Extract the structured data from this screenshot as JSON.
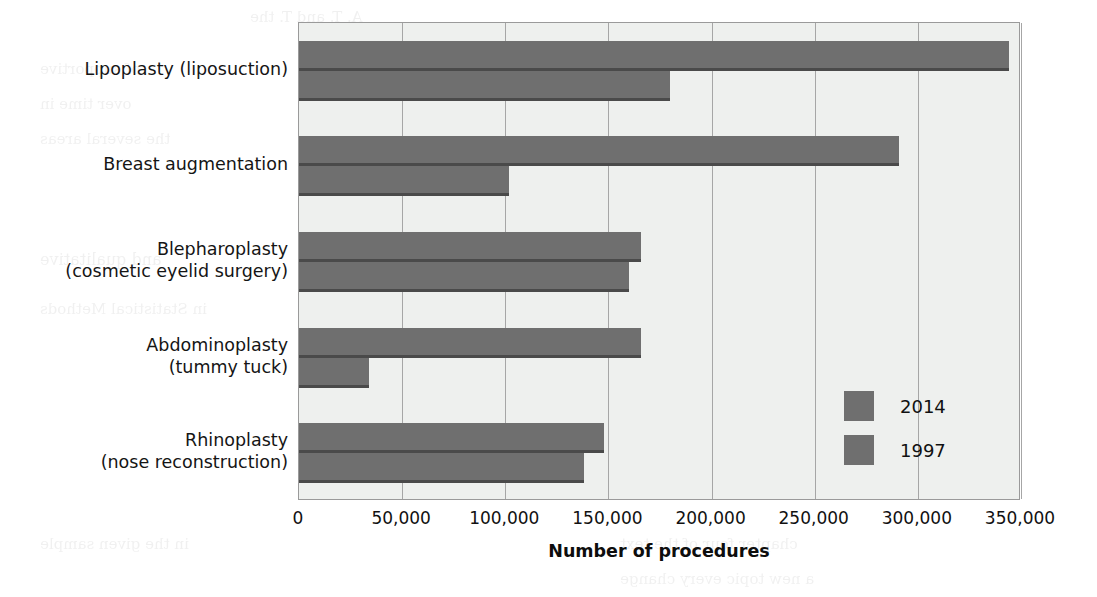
{
  "chart_data": {
    "type": "bar",
    "orientation": "horizontal",
    "title": "",
    "xlabel": "Number of procedures",
    "ylabel": "",
    "xlim": [
      0,
      350000
    ],
    "xticks": [
      0,
      50000,
      100000,
      150000,
      200000,
      250000,
      300000,
      350000
    ],
    "xtick_labels": [
      "0",
      "50,000",
      "100,000",
      "150,000",
      "200,000",
      "250,000",
      "300,000",
      "350,000"
    ],
    "grid": "vertical",
    "legend_position": "inside-lower-right",
    "categories": [
      "Lipoplasty (liposuction)",
      "Breast augmentation",
      "Blepharoplasty\n(cosmetic eyelid surgery)",
      "Abdominoplasty\n(tummy tuck)",
      "Rhinoplasty\n(nose reconstruction)"
    ],
    "category_lines": [
      [
        "Lipoplasty (liposuction)"
      ],
      [
        "Breast augmentation"
      ],
      [
        "Blepharoplasty",
        "(cosmetic eyelid surgery)"
      ],
      [
        "Abdominoplasty",
        "(tummy tuck)"
      ],
      [
        "Rhinoplasty",
        "(nose reconstruction)"
      ]
    ],
    "series": [
      {
        "name": "2014",
        "color": "#6f6f6f",
        "values": [
          344000,
          291000,
          166000,
          166000,
          148000
        ]
      },
      {
        "name": "1997",
        "color": "#6f6f6f",
        "values": [
          180000,
          102000,
          160000,
          34000,
          138000
        ]
      }
    ]
  },
  "legend": {
    "entries": [
      {
        "label": "2014"
      },
      {
        "label": "1997"
      }
    ]
  },
  "axis": {
    "x_title": "Number of procedures"
  },
  "ghost_text": [
    "A. T. and  T.  the",
    "of supportive",
    "over time in",
    "the several areas",
    "and qualitative",
    "in  Statistical  Methods",
    "the data of the",
    "the  number  of  each  page",
    "so  that  every  change",
    "Likert  scale  responses",
    "in  the  given  sample",
    "chapter  four  of  the  text",
    "a  new  topic  every  change"
  ]
}
